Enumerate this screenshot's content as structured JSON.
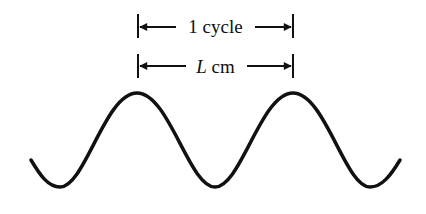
{
  "diagram": {
    "type": "sine-wave-wavelength",
    "labels": {
      "cycle_label": "1 cycle",
      "length_var": "L",
      "length_unit": " cm"
    },
    "wave": {
      "cycles_shown": 2.5,
      "stroke_color": "#111111"
    },
    "dimension_lines": [
      {
        "name": "cycle-dimension",
        "text": "1 cycle"
      },
      {
        "name": "length-dimension",
        "text": "L cm"
      }
    ]
  }
}
